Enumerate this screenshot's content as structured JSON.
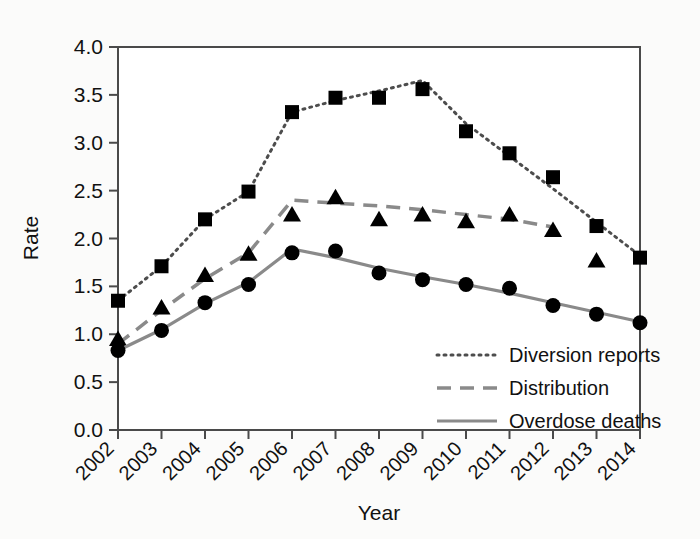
{
  "chart_data": {
    "type": "line",
    "title": "",
    "xlabel": "Year",
    "ylabel": "Rate",
    "x": [
      2002,
      2003,
      2004,
      2005,
      2006,
      2007,
      2008,
      2009,
      2010,
      2011,
      2012,
      2013,
      2014
    ],
    "categories": [
      "2002",
      "2003",
      "2004",
      "2005",
      "2006",
      "2007",
      "2008",
      "2009",
      "2010",
      "2011",
      "2012",
      "2013",
      "2014"
    ],
    "xlim": [
      2002,
      2014
    ],
    "ylim": [
      0.0,
      4.0
    ],
    "yticks": [
      "0.0",
      "0.5",
      "1.0",
      "1.5",
      "2.0",
      "2.5",
      "3.0",
      "3.5",
      "4.0"
    ],
    "ytick_values": [
      0.0,
      0.5,
      1.0,
      1.5,
      2.0,
      2.5,
      3.0,
      3.5,
      4.0
    ],
    "grid": false,
    "legend_position": "lower right",
    "series": [
      {
        "name": "Diversion reports",
        "marker": "square",
        "linestyle": "dotted",
        "color": "#000000",
        "values": [
          1.35,
          1.71,
          2.2,
          2.49,
          3.32,
          3.47,
          3.47,
          3.56,
          3.12,
          2.89,
          2.64,
          2.13,
          1.8
        ],
        "line_values": [
          1.35,
          1.71,
          2.2,
          2.49,
          3.32,
          3.44,
          3.54,
          3.65,
          3.2,
          2.86,
          2.52,
          2.17,
          1.82
        ]
      },
      {
        "name": "Distribution",
        "marker": "triangle",
        "linestyle": "dashed",
        "color": "#000000",
        "values": [
          0.95,
          1.28,
          1.62,
          1.84,
          2.25,
          2.43,
          2.2,
          2.25,
          2.18,
          2.25,
          2.09,
          1.77,
          null
        ],
        "line_values": [
          0.9,
          1.25,
          1.58,
          1.85,
          2.4,
          2.37,
          2.34,
          2.3,
          2.25,
          2.2,
          2.12,
          null,
          null
        ]
      },
      {
        "name": "Overdose deaths",
        "marker": "circle",
        "linestyle": "solid",
        "color": "#000000",
        "values": [
          0.83,
          1.04,
          1.33,
          1.52,
          1.85,
          1.87,
          1.64,
          1.57,
          1.52,
          1.48,
          1.3,
          1.21,
          1.12
        ],
        "line_values": [
          0.83,
          1.05,
          1.32,
          1.54,
          1.89,
          1.8,
          1.69,
          1.6,
          1.52,
          1.43,
          1.33,
          1.23,
          1.13
        ]
      }
    ]
  },
  "legend": {
    "items": [
      {
        "label": "Diversion reports",
        "style": "dotted"
      },
      {
        "label": "Distribution",
        "style": "dashed"
      },
      {
        "label": "Overdose deaths",
        "style": "solid"
      }
    ]
  },
  "axes": {
    "y_title": "Rate",
    "x_title": "Year"
  },
  "colors": {
    "series": "#000000",
    "axis": "#4a4a4a",
    "background": "#fbfbfa"
  }
}
